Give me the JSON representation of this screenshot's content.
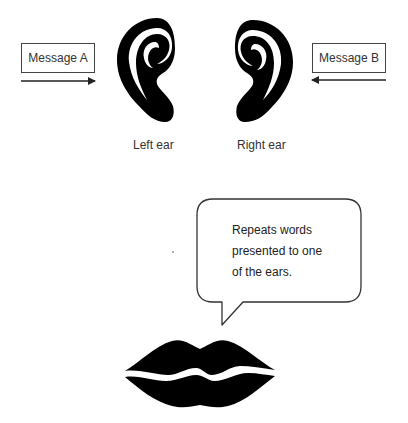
{
  "diagram": {
    "type": "dichotic-listening-shadowing",
    "messages": [
      {
        "id": "a",
        "label": "Message A",
        "arrow_direction": "right"
      },
      {
        "id": "b",
        "label": "Message B",
        "arrow_direction": "left"
      }
    ],
    "ears": [
      {
        "id": "left",
        "label": "Left ear"
      },
      {
        "id": "right",
        "label": "Right ear"
      }
    ],
    "speech_bubble": {
      "lines": [
        "Repeats words",
        "presented to one",
        "of the ears."
      ]
    },
    "mouth": {
      "icon": "lips-icon"
    },
    "colors": {
      "ink": "#000000",
      "border": "#444444",
      "text": "#222222",
      "background": "#ffffff"
    }
  }
}
